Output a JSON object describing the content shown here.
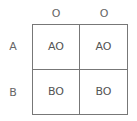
{
  "columns": [
    "O",
    "O"
  ],
  "rows": [
    "A",
    "B"
  ],
  "cells": [
    [
      "AO",
      "AO"
    ],
    [
      "BO",
      "BO"
    ]
  ]
}
